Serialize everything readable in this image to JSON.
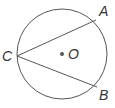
{
  "diagram": {
    "type": "circle-inscribed-angle",
    "circle": {
      "cx": 62,
      "cy": 54,
      "r": 45,
      "stroke": "#555555"
    },
    "center": {
      "label": "O",
      "x": 62,
      "y": 54
    },
    "points": [
      {
        "label": "A",
        "x": 96,
        "y": 20
      },
      {
        "label": "B",
        "x": 97,
        "y": 87
      },
      {
        "label": "C",
        "x": 17,
        "y": 56
      }
    ],
    "segments": [
      [
        "C",
        "A"
      ],
      [
        "C",
        "B"
      ]
    ]
  }
}
